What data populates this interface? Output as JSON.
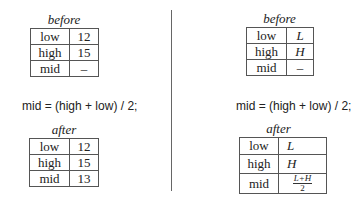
{
  "left_panel": {
    "before": {
      "caption": "before",
      "rows": [
        {
          "label": "low",
          "value": "12"
        },
        {
          "label": "high",
          "value": "15"
        },
        {
          "label": "mid",
          "value": "–"
        }
      ]
    },
    "formula": "mid = (high + low) / 2;",
    "after": {
      "caption": "after",
      "rows": [
        {
          "label": "low",
          "value": "12"
        },
        {
          "label": "high",
          "value": "15"
        },
        {
          "label": "mid",
          "value": "13"
        }
      ]
    }
  },
  "right_panel": {
    "before": {
      "caption": "before",
      "rows": [
        {
          "label": "low",
          "value": "L"
        },
        {
          "label": "high",
          "value": "H"
        },
        {
          "label": "mid",
          "value": "–"
        }
      ]
    },
    "formula": "mid = (high + low) / 2;",
    "after": {
      "caption": "after",
      "rows": [
        {
          "label": "low",
          "value": "L"
        },
        {
          "label": "high",
          "value": "H"
        },
        {
          "label": "mid",
          "value_numerator": "L+H",
          "value_denominator": "2"
        }
      ]
    }
  }
}
